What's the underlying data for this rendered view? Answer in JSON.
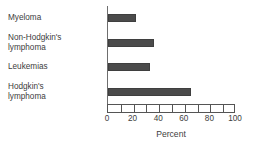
{
  "chart_data": {
    "type": "bar",
    "orientation": "horizontal",
    "title": "",
    "xlabel": "Percent",
    "ylabel": "",
    "categories": [
      "Myeloma",
      "Non-Hodgkin's\nlymphoma",
      "Leukemias",
      "Hodgkin's\nlymphoma"
    ],
    "values": [
      22,
      36,
      33,
      65
    ],
    "xlim": [
      0,
      100
    ],
    "xticks": [
      0,
      20,
      40,
      60,
      80,
      100
    ],
    "xtick_labels": [
      "0",
      "20",
      "40",
      "60",
      "80",
      "100"
    ],
    "minor_tick_interval": 10,
    "grid": false,
    "legend": false,
    "bar_color": "#4b4b4b",
    "axis_color": "#555555",
    "text_color": "#3d3d3d",
    "background_color": "#ffffff"
  }
}
